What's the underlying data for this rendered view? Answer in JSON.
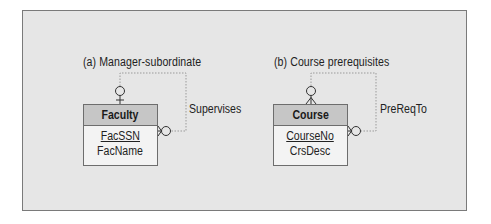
{
  "diagrams": [
    {
      "caption": "(a) Manager-subordinate",
      "entity": {
        "name": "Faculty",
        "attributes": [
          {
            "name": "FacSSN",
            "primary_key": true
          },
          {
            "name": "FacName",
            "primary_key": false
          }
        ]
      },
      "relationship": {
        "label": "Supervises",
        "one_end": "zero-or-one (circle + bar)",
        "many_end": "zero-or-many (circle + crow's foot)"
      }
    },
    {
      "caption": "(b) Course prerequisites",
      "entity": {
        "name": "Course",
        "attributes": [
          {
            "name": "CourseNo",
            "primary_key": true
          },
          {
            "name": "CrsDesc",
            "primary_key": false
          }
        ]
      },
      "relationship": {
        "label": "PreReqTo",
        "one_end": "zero-or-many (circle + crow's foot)",
        "many_end": "zero-or-many (circle + crow's foot)"
      }
    }
  ],
  "colors": {
    "frame_background": "#e6e6e6",
    "frame_border": "#7a7a7a",
    "entity_header": "#c6c6c6",
    "entity_body": "#f3f3f3",
    "relationship_line": "#9a9a9a"
  }
}
